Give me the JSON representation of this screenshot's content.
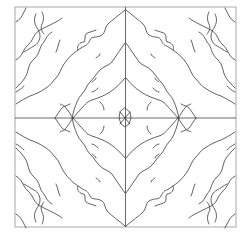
{
  "figure": {
    "colors": {
      "background": "#ffffff",
      "frame": "#a9a9a9",
      "line": "#3a3a3a",
      "axis": "#444444"
    },
    "frame": {
      "x": 15,
      "y": 7,
      "width": 221,
      "height": 220
    },
    "center": {
      "x": 125.5,
      "y": 118
    },
    "quadrant_paths": [
      "M125 10 C118 16 112 20 108 24 C104 28 106 34 100 36 C95 38 92 36 90 40 C88 44 86 46 84 46 L78 50 C72 54 68 58 64 64 C60 70 60 74 56 78 C52 82 50 86 46 88 C40 92 36 94 30 96 C26 98 22 100 16 104",
      "M78 50 C76 46 80 42 84 42 C86 40 84 36 86 34 C88 32 92 32 96 30",
      "M125 43 C120 50 116 56 112 62 C108 66 104 66 100 70 C96 74 94 78 90 82 C86 86 86 90 82 94 C78 98 76 104 74 110 L72 118",
      "M125 78 C120 84 116 88 110 92 C104 96 98 98 92 100 C86 102 84 106 80 110 L73 118",
      "M73 118 C70 114 68 110 66 108 C64 104 62 106 60 104",
      "M55 118 C58 114 60 110 62 108 C64 106 66 106 70 104",
      "M100 102 C102 104 104 106 104 110",
      "M92 82 C94 80 96 80 96 78",
      "M96 58 C98 56 100 56 100 54",
      "M98 88 C96 90 94 92 92 92",
      "M16 60 C20 58 22 54 24 50 C26 46 30 44 32 40 C34 36 36 32 40 30 C44 28 48 26 52 24 C56 22 60 20 62 18",
      "M16 88 C20 84 24 80 26 76 C28 72 28 68 30 64 C32 60 36 58 38 54 C40 50 40 46 44 42 C46 38 48 34 52 32",
      "M36 14 C34 18 34 22 36 26 C38 30 40 32 40 36 C40 40 38 44 34 46 C30 48 28 50 24 52",
      "M42 12 C44 16 44 20 42 24 C40 28 42 32 44 34",
      "M16 22 C20 20 22 16 24 12 L26 8",
      "M16 92 C20 90 22 88 24 86",
      "M60 40 C58 44 58 48 56 52"
    ],
    "center_hexagon": "M125 108 L130 112 L131 118 L129 124 L125 127 L121 124 L119 118 L120 112 Z",
    "center_inner_lines": "M120 112 L130 124 M130 112 L120 124"
  }
}
